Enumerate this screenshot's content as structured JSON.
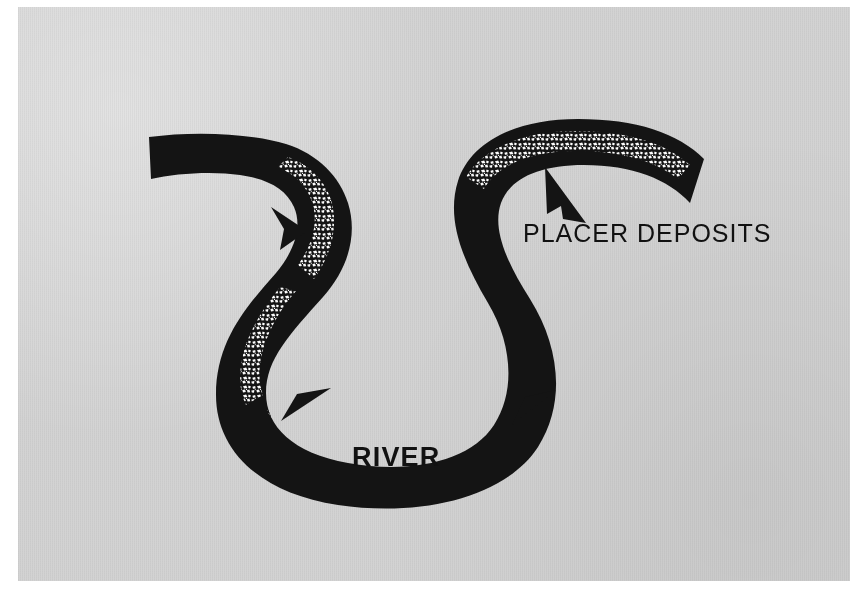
{
  "figure": {
    "kind": "geology-diagram",
    "width": 850,
    "height": 591,
    "background_color": "#d3d3d3",
    "page_color": "#ffffff",
    "ink_color": "#141414",
    "deposit_color": "#ffffff"
  },
  "labels": {
    "placer": "PLACER DEPOSITS",
    "river": "RIVER"
  },
  "diagram_data": {
    "type": "diagram",
    "title": "",
    "elements": [
      {
        "name": "river-channel",
        "kind": "meandering-band",
        "fill": "#141414",
        "description": "Thick black meandering river band entering from upper left, bending south, looping in a broad U, then rising and sweeping east to terminate at upper right."
      },
      {
        "name": "placer-deposit-upper-left",
        "kind": "gravel-stipple",
        "fill": "#ffffff",
        "location": "inside of first bend, upper left",
        "label_ref": "placer"
      },
      {
        "name": "placer-deposit-left",
        "kind": "gravel-stipple",
        "fill": "#ffffff",
        "location": "inside of left bend, mid-left",
        "label_ref": "placer"
      },
      {
        "name": "placer-deposit-bottom",
        "kind": "gravel-stipple",
        "fill": "#ffffff",
        "location": "inside of bottom U bend",
        "label_ref": "placer"
      },
      {
        "name": "placer-deposit-upper-right",
        "kind": "gravel-stipple",
        "fill": "#ffffff",
        "location": "inside of upper right bend",
        "label_ref": "placer"
      }
    ],
    "pointers": [
      {
        "name": "pointer-upper-left",
        "direction": "up-right",
        "points_to": "placer-deposit-upper-left"
      },
      {
        "name": "pointer-lower-left",
        "direction": "left-down",
        "points_to": "placer-deposit-bottom"
      },
      {
        "name": "pointer-lower-right",
        "direction": "left-down",
        "points_to": "placer-deposit-bottom"
      },
      {
        "name": "pointer-placer-label",
        "direction": "up-left",
        "points_to": "placer-deposit-upper-right",
        "label_ref": "placer"
      }
    ]
  }
}
